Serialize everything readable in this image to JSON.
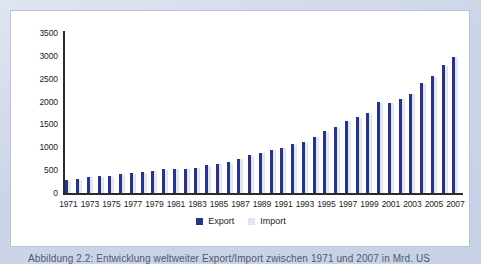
{
  "panel": {
    "background_color": "#ffffff",
    "page_background_color": "#ccd5e8"
  },
  "caption": {
    "text": "Abbildung 2.2: Entwicklung weltweiter Export/Import zwischen 1971 und 2007 in Mrd. US"
  },
  "legend": {
    "export_label": "Export",
    "import_label": "Import",
    "export_color": "#2a3480",
    "import_color": "#e6eaf4"
  },
  "chart_data": {
    "type": "bar",
    "title": "",
    "subtitle": "",
    "xlabel": "",
    "ylabel": "",
    "ylim": [
      0,
      3500
    ],
    "yticks": [
      0,
      500,
      1000,
      1500,
      2000,
      2500,
      3000,
      3500
    ],
    "ytick_labels": [
      "0",
      "500",
      "1000",
      "1500",
      "2000",
      "2500",
      "3000",
      "3500"
    ],
    "grid": false,
    "legend_position": "bottom-center",
    "categories": [
      "1971",
      "1972",
      "1973",
      "1974",
      "1975",
      "1976",
      "1977",
      "1978",
      "1979",
      "1980",
      "1981",
      "1982",
      "1983",
      "1984",
      "1985",
      "1986",
      "1987",
      "1988",
      "1989",
      "1990",
      "1991",
      "1992",
      "1993",
      "1994",
      "1995",
      "1996",
      "1997",
      "1998",
      "1999",
      "2000",
      "2001",
      "2002",
      "2003",
      "2004",
      "2005",
      "2006",
      "2007"
    ],
    "xtick_labels": [
      "1971",
      "1973",
      "1975",
      "1977",
      "1979",
      "1981",
      "1983",
      "1985",
      "1987",
      "1989",
      "1991",
      "1993",
      "1995",
      "1997",
      "1999",
      "2001",
      "2003",
      "2005",
      "2007"
    ],
    "series": [
      {
        "name": "Export",
        "color": "#2a3480",
        "values": [
          280,
          310,
          355,
          375,
          370,
          415,
          440,
          455,
          490,
          520,
          530,
          530,
          555,
          605,
          640,
          675,
          755,
          825,
          880,
          950,
          995,
          1070,
          1120,
          1235,
          1355,
          1440,
          1585,
          1665,
          1750,
          1985,
          1980,
          2065,
          2175,
          2400,
          2555,
          2790,
          2985
        ]
      },
      {
        "name": "Import",
        "color": "#e6eaf4",
        "values": [
          260,
          295,
          340,
          360,
          355,
          400,
          425,
          440,
          475,
          505,
          515,
          515,
          540,
          590,
          625,
          660,
          740,
          810,
          865,
          935,
          980,
          1055,
          1105,
          1220,
          1340,
          1425,
          1570,
          1650,
          1735,
          1970,
          1965,
          2050,
          2160,
          2385,
          2540,
          2775,
          2970
        ]
      }
    ]
  }
}
